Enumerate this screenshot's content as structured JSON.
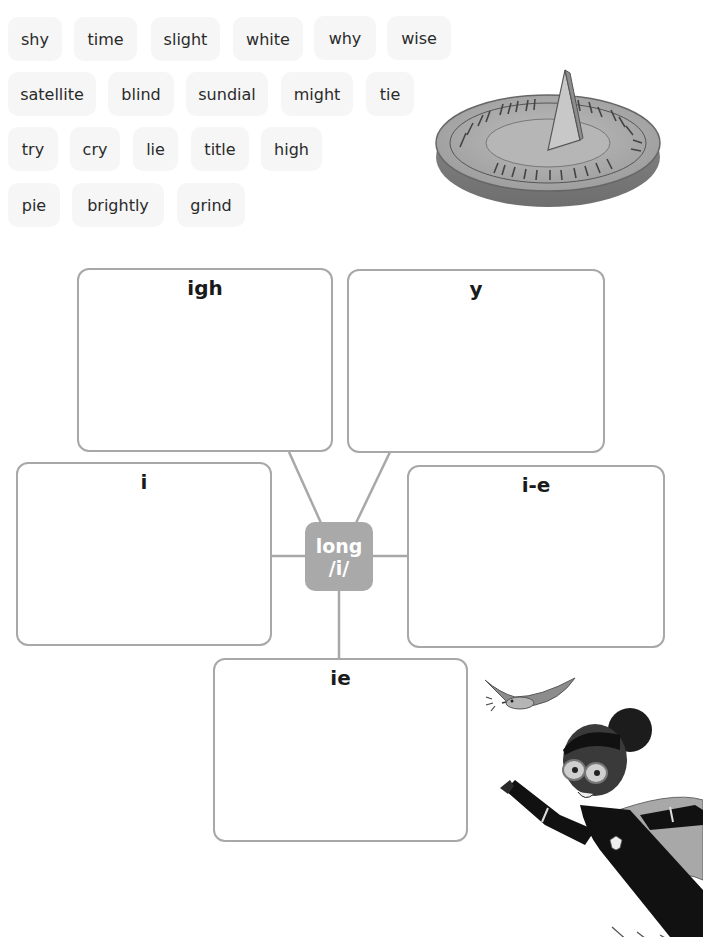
{
  "word_bank": {
    "rows": [
      [
        "shy",
        "time",
        "slight",
        "white",
        "why",
        "wise"
      ],
      [
        "satellite",
        "blind",
        "sundial",
        "might",
        "tie"
      ],
      [
        "try",
        "cry",
        "lie",
        "title",
        "high"
      ],
      [
        "pie",
        "brightly",
        "grind"
      ]
    ]
  },
  "web": {
    "center": {
      "line1": "long",
      "line2": "/i/"
    },
    "boxes": {
      "igh": "igh",
      "y": "y",
      "i": "i",
      "i_e": "i-e",
      "ie": "ie"
    }
  },
  "illustrations": {
    "sundial": "sundial-image",
    "bird": "bird-image",
    "superhero": "flying-superhero-image"
  },
  "colors": {
    "tile_bg": "#f6f6f6",
    "box_border": "#a8a8a8",
    "center_bg": "#a9a9a9"
  }
}
